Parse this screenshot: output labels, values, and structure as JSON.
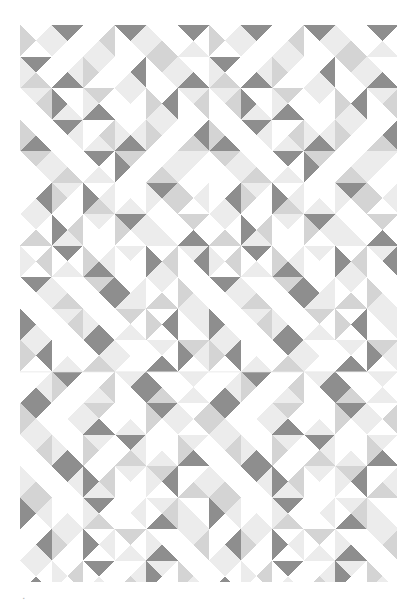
{
  "page": {
    "width": 417,
    "height": 607,
    "background_color": "#ffffff",
    "corner_mark_text": "▪"
  },
  "artwork": {
    "name": "triangle-tile-pattern",
    "description": "Seamless grid of square tiles, each divided by both diagonals into four triangles shaded in four tones of gray.",
    "bounds": {
      "x": 20,
      "y": 25,
      "width": 377,
      "height": 557
    },
    "cell_size": 31.5,
    "columns": 12,
    "rows": 18,
    "palette": {
      "white": "#ffffff",
      "light": "#ececec",
      "mid": "#d4d4d4",
      "dark": "#8e8e8e"
    },
    "tone_keys": [
      "white",
      "light",
      "mid",
      "dark"
    ],
    "seam_rows": [
      11
    ],
    "seam_color": "#e6e6e6",
    "tiles": [
      [
        [
          0,
          1,
          0,
          2
        ],
        [
          3,
          0,
          0,
          1
        ],
        [
          0,
          2,
          1,
          0
        ],
        [
          3,
          1,
          0,
          0
        ],
        [
          0,
          0,
          2,
          1
        ],
        [
          3,
          0,
          1,
          0
        ],
        [
          0,
          1,
          0,
          2
        ],
        [
          3,
          0,
          0,
          1
        ],
        [
          0,
          2,
          1,
          0
        ],
        [
          3,
          1,
          0,
          0
        ],
        [
          0,
          0,
          2,
          1
        ],
        [
          3,
          0,
          1,
          0
        ]
      ],
      [
        [
          3,
          0,
          2,
          1
        ],
        [
          0,
          1,
          3,
          0
        ],
        [
          1,
          0,
          0,
          2
        ],
        [
          0,
          3,
          1,
          0
        ],
        [
          2,
          1,
          0,
          0
        ],
        [
          0,
          0,
          3,
          1
        ],
        [
          3,
          0,
          2,
          1
        ],
        [
          0,
          1,
          3,
          0
        ],
        [
          1,
          0,
          0,
          2
        ],
        [
          0,
          3,
          1,
          0
        ],
        [
          2,
          1,
          0,
          0
        ],
        [
          0,
          0,
          3,
          1
        ]
      ],
      [
        [
          1,
          2,
          0,
          0
        ],
        [
          0,
          0,
          1,
          3
        ],
        [
          2,
          0,
          3,
          1
        ],
        [
          1,
          0,
          0,
          0
        ],
        [
          0,
          3,
          1,
          2
        ],
        [
          1,
          2,
          0,
          0
        ],
        [
          1,
          2,
          0,
          0
        ],
        [
          0,
          0,
          1,
          3
        ],
        [
          2,
          0,
          3,
          1
        ],
        [
          1,
          0,
          0,
          0
        ],
        [
          0,
          3,
          1,
          2
        ],
        [
          1,
          2,
          0,
          0
        ]
      ],
      [
        [
          0,
          0,
          3,
          2
        ],
        [
          3,
          1,
          0,
          0
        ],
        [
          0,
          2,
          1,
          0
        ],
        [
          0,
          1,
          3,
          1
        ],
        [
          1,
          0,
          0,
          2
        ],
        [
          0,
          3,
          2,
          0
        ],
        [
          0,
          0,
          3,
          2
        ],
        [
          3,
          1,
          0,
          0
        ],
        [
          0,
          2,
          1,
          0
        ],
        [
          0,
          1,
          3,
          1
        ],
        [
          1,
          0,
          0,
          2
        ],
        [
          0,
          3,
          2,
          0
        ]
      ],
      [
        [
          2,
          1,
          0,
          0
        ],
        [
          0,
          0,
          2,
          1
        ],
        [
          3,
          0,
          1,
          0
        ],
        [
          2,
          0,
          0,
          3
        ],
        [
          0,
          1,
          2,
          0
        ],
        [
          1,
          0,
          0,
          1
        ],
        [
          2,
          1,
          0,
          0
        ],
        [
          0,
          0,
          2,
          1
        ],
        [
          3,
          0,
          1,
          0
        ],
        [
          2,
          0,
          0,
          3
        ],
        [
          0,
          1,
          2,
          0
        ],
        [
          1,
          0,
          0,
          1
        ]
      ],
      [
        [
          0,
          3,
          1,
          0
        ],
        [
          1,
          0,
          0,
          2
        ],
        [
          0,
          1,
          2,
          3
        ],
        [
          0,
          0,
          1,
          0
        ],
        [
          3,
          2,
          0,
          1
        ],
        [
          0,
          1,
          0,
          2
        ],
        [
          0,
          3,
          1,
          0
        ],
        [
          1,
          0,
          0,
          2
        ],
        [
          0,
          1,
          2,
          3
        ],
        [
          0,
          0,
          1,
          0
        ],
        [
          3,
          2,
          0,
          1
        ],
        [
          0,
          1,
          0,
          2
        ]
      ],
      [
        [
          1,
          0,
          2,
          0
        ],
        [
          0,
          2,
          1,
          3
        ],
        [
          1,
          0,
          0,
          0
        ],
        [
          3,
          1,
          0,
          2
        ],
        [
          0,
          0,
          1,
          1
        ],
        [
          2,
          0,
          3,
          0
        ],
        [
          1,
          0,
          2,
          0
        ],
        [
          0,
          2,
          1,
          3
        ],
        [
          1,
          0,
          0,
          0
        ],
        [
          3,
          1,
          0,
          2
        ],
        [
          0,
          0,
          1,
          1
        ],
        [
          2,
          0,
          3,
          0
        ]
      ],
      [
        [
          0,
          2,
          0,
          1
        ],
        [
          3,
          0,
          1,
          0
        ],
        [
          0,
          1,
          3,
          2
        ],
        [
          1,
          0,
          0,
          0
        ],
        [
          0,
          2,
          1,
          3
        ],
        [
          1,
          3,
          0,
          0
        ],
        [
          0,
          2,
          0,
          1
        ],
        [
          3,
          0,
          1,
          0
        ],
        [
          0,
          1,
          3,
          2
        ],
        [
          1,
          0,
          0,
          0
        ],
        [
          0,
          2,
          1,
          3
        ],
        [
          1,
          3,
          0,
          0
        ]
      ],
      [
        [
          3,
          1,
          0,
          0
        ],
        [
          0,
          0,
          2,
          1
        ],
        [
          2,
          3,
          0,
          0
        ],
        [
          0,
          1,
          1,
          3
        ],
        [
          1,
          0,
          2,
          0
        ],
        [
          0,
          0,
          1,
          2
        ],
        [
          3,
          1,
          0,
          0
        ],
        [
          0,
          0,
          2,
          1
        ],
        [
          2,
          3,
          0,
          0
        ],
        [
          0,
          1,
          1,
          3
        ],
        [
          1,
          0,
          2,
          0
        ],
        [
          0,
          0,
          1,
          2
        ]
      ],
      [
        [
          0,
          0,
          1,
          3
        ],
        [
          1,
          2,
          0,
          0
        ],
        [
          0,
          0,
          3,
          1
        ],
        [
          2,
          0,
          1,
          0
        ],
        [
          0,
          3,
          0,
          2
        ],
        [
          1,
          1,
          0,
          0
        ],
        [
          0,
          0,
          1,
          3
        ],
        [
          1,
          2,
          0,
          0
        ],
        [
          0,
          0,
          3,
          1
        ],
        [
          2,
          0,
          1,
          0
        ],
        [
          0,
          3,
          0,
          2
        ],
        [
          1,
          1,
          0,
          0
        ]
      ],
      [
        [
          1,
          3,
          0,
          2
        ],
        [
          0,
          0,
          1,
          0
        ],
        [
          3,
          1,
          2,
          0
        ],
        [
          0,
          0,
          0,
          1
        ],
        [
          1,
          0,
          3,
          0
        ],
        [
          2,
          1,
          0,
          3
        ],
        [
          1,
          3,
          0,
          2
        ],
        [
          0,
          0,
          1,
          0
        ],
        [
          3,
          1,
          2,
          0
        ],
        [
          0,
          0,
          0,
          1
        ],
        [
          1,
          0,
          3,
          0
        ],
        [
          2,
          1,
          0,
          3
        ]
      ],
      [
        [
          0,
          1,
          3,
          0
        ],
        [
          3,
          0,
          0,
          2
        ],
        [
          0,
          2,
          1,
          0
        ],
        [
          1,
          3,
          0,
          0
        ],
        [
          0,
          0,
          2,
          3
        ],
        [
          1,
          0,
          1,
          0
        ],
        [
          0,
          1,
          3,
          0
        ],
        [
          3,
          0,
          0,
          2
        ],
        [
          0,
          2,
          1,
          0
        ],
        [
          1,
          3,
          0,
          0
        ],
        [
          0,
          0,
          2,
          3
        ],
        [
          1,
          0,
          1,
          0
        ]
      ],
      [
        [
          3,
          0,
          1,
          2
        ],
        [
          0,
          1,
          0,
          0
        ],
        [
          2,
          0,
          3,
          1
        ],
        [
          0,
          0,
          1,
          0
        ],
        [
          3,
          1,
          0,
          2
        ],
        [
          0,
          2,
          0,
          1
        ],
        [
          3,
          0,
          1,
          2
        ],
        [
          0,
          1,
          0,
          0
        ],
        [
          2,
          0,
          3,
          1
        ],
        [
          0,
          0,
          1,
          0
        ],
        [
          3,
          1,
          0,
          2
        ],
        [
          0,
          2,
          0,
          1
        ]
      ],
      [
        [
          1,
          2,
          0,
          0
        ],
        [
          0,
          0,
          3,
          1
        ],
        [
          1,
          0,
          0,
          2
        ],
        [
          3,
          1,
          2,
          0
        ],
        [
          0,
          0,
          1,
          0
        ],
        [
          1,
          0,
          3,
          2
        ],
        [
          1,
          2,
          0,
          0
        ],
        [
          0,
          0,
          3,
          1
        ],
        [
          1,
          0,
          0,
          2
        ],
        [
          3,
          1,
          2,
          0
        ],
        [
          0,
          0,
          1,
          0
        ],
        [
          1,
          0,
          3,
          2
        ]
      ],
      [
        [
          0,
          0,
          2,
          1
        ],
        [
          3,
          1,
          0,
          0
        ],
        [
          0,
          2,
          1,
          3
        ],
        [
          1,
          0,
          0,
          0
        ],
        [
          2,
          3,
          0,
          1
        ],
        [
          0,
          1,
          2,
          0
        ],
        [
          0,
          0,
          2,
          1
        ],
        [
          3,
          1,
          0,
          0
        ],
        [
          0,
          2,
          1,
          3
        ],
        [
          1,
          0,
          0,
          0
        ],
        [
          2,
          3,
          0,
          1
        ],
        [
          0,
          1,
          2,
          0
        ]
      ],
      [
        [
          2,
          1,
          0,
          3
        ],
        [
          0,
          0,
          1,
          0
        ],
        [
          3,
          0,
          2,
          1
        ],
        [
          0,
          1,
          0,
          0
        ],
        [
          1,
          2,
          3,
          0
        ],
        [
          0,
          0,
          1,
          1
        ],
        [
          2,
          1,
          0,
          3
        ],
        [
          0,
          0,
          1,
          0
        ],
        [
          3,
          0,
          2,
          1
        ],
        [
          0,
          1,
          0,
          0
        ],
        [
          1,
          2,
          3,
          0
        ],
        [
          0,
          0,
          1,
          1
        ]
      ],
      [
        [
          0,
          3,
          1,
          0
        ],
        [
          1,
          0,
          0,
          2
        ],
        [
          0,
          1,
          0,
          3
        ],
        [
          2,
          0,
          1,
          0
        ],
        [
          0,
          0,
          3,
          1
        ],
        [
          1,
          2,
          0,
          0
        ],
        [
          0,
          3,
          1,
          0
        ],
        [
          1,
          0,
          0,
          2
        ],
        [
          0,
          1,
          0,
          3
        ],
        [
          2,
          0,
          1,
          0
        ],
        [
          0,
          0,
          3,
          1
        ],
        [
          1,
          2,
          0,
          0
        ]
      ],
      [
        [
          1,
          0,
          3,
          0
        ],
        [
          0,
          2,
          0,
          1
        ],
        [
          3,
          0,
          1,
          0
        ],
        [
          0,
          1,
          2,
          0
        ],
        [
          1,
          0,
          0,
          3
        ],
        [
          0,
          0,
          1,
          2
        ],
        [
          1,
          0,
          3,
          0
        ],
        [
          0,
          2,
          0,
          1
        ],
        [
          3,
          0,
          1,
          0
        ],
        [
          0,
          1,
          2,
          0
        ],
        [
          1,
          0,
          0,
          3
        ],
        [
          0,
          0,
          1,
          2
        ]
      ]
    ]
  }
}
